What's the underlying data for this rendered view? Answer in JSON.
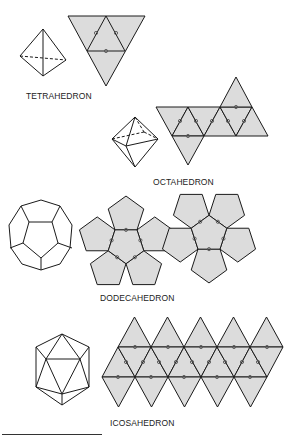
{
  "colors": {
    "fill": "#dcdcdc",
    "stroke": "#1a1a1a",
    "dot": "#555555",
    "background": "#ffffff"
  },
  "labels": {
    "tetrahedron": "TETRAHEDRON",
    "octahedron": "OCTAHEDRON",
    "dodecahedron": "DODECAHEDRON",
    "icosahedron": "ICOSAHEDRON"
  },
  "label_positions": {
    "tetrahedron": [
      26,
      91
    ],
    "octahedron": [
      153,
      177
    ],
    "dodecahedron": [
      100,
      293
    ],
    "icosahedron": [
      110,
      418
    ]
  },
  "tetra_net": {
    "outer": [
      [
        68,
        16
      ],
      [
        145,
        16
      ],
      [
        106,
        86
      ]
    ],
    "inner": [
      [
        106,
        16
      ],
      [
        87,
        51
      ],
      [
        125,
        51
      ]
    ],
    "dots": [
      [
        96,
        33
      ],
      [
        116,
        33
      ],
      [
        106,
        51
      ]
    ]
  },
  "tetra_solid": {
    "edges": [
      [
        [
          43,
          29
        ],
        [
          20,
          56
        ]
      ],
      [
        [
          43,
          29
        ],
        [
          66,
          60
        ]
      ],
      [
        [
          43,
          29
        ],
        [
          43,
          76
        ]
      ],
      [
        [
          20,
          56
        ],
        [
          43,
          76
        ]
      ],
      [
        [
          66,
          60
        ],
        [
          43,
          76
        ]
      ]
    ],
    "dashed": [
      [
        [
          20,
          56
        ],
        [
          66,
          60
        ]
      ]
    ]
  },
  "octa_net": {
    "triangles": [
      [
        [
          156,
          107
        ],
        [
          188,
          107
        ],
        [
          172,
          136
        ]
      ],
      [
        [
          172,
          136
        ],
        [
          188,
          107
        ],
        [
          204,
          136
        ]
      ],
      [
        [
          188,
          107
        ],
        [
          220,
          107
        ],
        [
          204,
          136
        ]
      ],
      [
        [
          204,
          136
        ],
        [
          220,
          107
        ],
        [
          236,
          136
        ]
      ],
      [
        [
          220,
          107
        ],
        [
          252,
          107
        ],
        [
          236,
          136
        ]
      ],
      [
        [
          236,
          136
        ],
        [
          252,
          107
        ],
        [
          268,
          136
        ]
      ],
      [
        [
          220,
          107
        ],
        [
          236,
          77
        ],
        [
          252,
          107
        ]
      ],
      [
        [
          172,
          136
        ],
        [
          204,
          136
        ],
        [
          188,
          165
        ]
      ]
    ],
    "dots": [
      [
        180,
        121
      ],
      [
        196,
        121
      ],
      [
        212,
        121
      ],
      [
        228,
        121
      ],
      [
        244,
        121
      ],
      [
        236,
        107
      ],
      [
        188,
        136
      ]
    ]
  },
  "octa_solid": {
    "edges": [
      [
        [
          135,
          117
        ],
        [
          112,
          139
        ]
      ],
      [
        [
          135,
          117
        ],
        [
          158,
          139
        ]
      ],
      [
        [
          135,
          117
        ],
        [
          126,
          146
        ]
      ],
      [
        [
          112,
          139
        ],
        [
          126,
          146
        ]
      ],
      [
        [
          126,
          146
        ],
        [
          158,
          139
        ]
      ],
      [
        [
          112,
          139
        ],
        [
          135,
          167
        ]
      ],
      [
        [
          158,
          139
        ],
        [
          135,
          167
        ]
      ],
      [
        [
          126,
          146
        ],
        [
          135,
          167
        ]
      ]
    ],
    "dashed": [
      [
        [
          135,
          117
        ],
        [
          144,
          132
        ]
      ],
      [
        [
          112,
          139
        ],
        [
          144,
          132
        ]
      ],
      [
        [
          144,
          132
        ],
        [
          158,
          139
        ]
      ]
    ]
  },
  "dodeca_nets": [
    {
      "center": [
        126,
        245
      ],
      "radius": 18.7,
      "rotation": 90
    },
    {
      "center": [
        209,
        234
      ],
      "radius": 18.7,
      "rotation": -90
    }
  ],
  "dodeca_solid": {
    "outer": [
      [
        41,
        200
      ],
      [
        60,
        206
      ],
      [
        72,
        225
      ],
      [
        70,
        248
      ],
      [
        60,
        264
      ],
      [
        41,
        270
      ],
      [
        22,
        264
      ],
      [
        11,
        248
      ],
      [
        9,
        225
      ],
      [
        21,
        206
      ]
    ],
    "inner": [
      [
        29,
        222
      ],
      [
        52,
        222
      ],
      [
        58,
        243
      ],
      [
        41,
        258
      ],
      [
        23,
        243
      ]
    ],
    "spokes": [
      [
        [
          29,
          222
        ],
        [
          21,
          206
        ]
      ],
      [
        [
          52,
          222
        ],
        [
          60,
          206
        ]
      ],
      [
        [
          58,
          243
        ],
        [
          72,
          248
        ]
      ],
      [
        [
          41,
          258
        ],
        [
          41,
          270
        ]
      ],
      [
        [
          23,
          243
        ],
        [
          10,
          248
        ]
      ]
    ]
  },
  "icosa_net": {
    "top_line_y": 347,
    "bottom_line_y": 377,
    "top_apex_y": 317,
    "bottom_apex_y": 407,
    "top_line_x": [
      118,
      151,
      184,
      217,
      250,
      283
    ],
    "bottom_line_x": [
      102,
      135,
      168,
      201,
      234,
      267
    ],
    "dots_top": [
      135,
      168,
      201,
      234,
      267
    ],
    "dots_bottom": [
      118,
      151,
      184,
      217,
      250
    ],
    "dots_mid_y": 362,
    "dots_mid": [
      126,
      143,
      159,
      176,
      192,
      209,
      225,
      242,
      258
    ]
  },
  "icosa_solid": {
    "edges": [
      [
        [
          62,
          334
        ],
        [
          36,
          347
        ]
      ],
      [
        [
          62,
          334
        ],
        [
          89,
          347
        ]
      ],
      [
        [
          36,
          347
        ],
        [
          36,
          387
        ]
      ],
      [
        [
          89,
          347
        ],
        [
          89,
          387
        ]
      ],
      [
        [
          36,
          387
        ],
        [
          62,
          405
        ]
      ],
      [
        [
          89,
          387
        ],
        [
          62,
          405
        ]
      ],
      [
        [
          46,
          359
        ],
        [
          80,
          359
        ]
      ],
      [
        [
          46,
          359
        ],
        [
          62,
          394
        ]
      ],
      [
        [
          80,
          359
        ],
        [
          62,
          394
        ]
      ],
      [
        [
          62,
          334
        ],
        [
          46,
          359
        ]
      ],
      [
        [
          62,
          334
        ],
        [
          80,
          359
        ]
      ],
      [
        [
          36,
          347
        ],
        [
          46,
          359
        ]
      ],
      [
        [
          89,
          347
        ],
        [
          80,
          359
        ]
      ],
      [
        [
          36,
          387
        ],
        [
          46,
          359
        ]
      ],
      [
        [
          89,
          387
        ],
        [
          80,
          359
        ]
      ],
      [
        [
          36,
          387
        ],
        [
          62,
          394
        ]
      ],
      [
        [
          89,
          387
        ],
        [
          62,
          394
        ]
      ],
      [
        [
          62,
          394
        ],
        [
          62,
          405
        ]
      ]
    ]
  }
}
